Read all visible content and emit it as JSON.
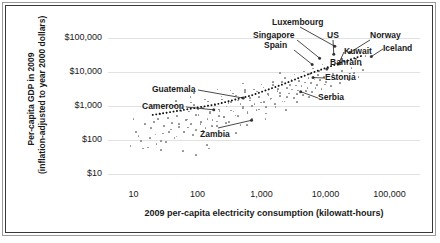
{
  "chart_data": {
    "type": "scatter",
    "title": "",
    "xlabel": "2009 per-capita electricity consumption (kilowatt-hours)",
    "ylabel_line1": "Per-capita GDP in 2009",
    "ylabel_line2": "(inflation-adjusted to year 2000 dollars)",
    "xscale": "log",
    "yscale": "log",
    "xlim": [
      4,
      300000
    ],
    "ylim": [
      6,
      300000
    ],
    "grid": true,
    "legend": "none",
    "xticks": [
      {
        "value": 10,
        "label": "10"
      },
      {
        "value": 100,
        "label": "100"
      },
      {
        "value": 1000,
        "label": "1,000"
      },
      {
        "value": 10000,
        "label": "10,000"
      },
      {
        "value": 100000,
        "label": "100,000"
      }
    ],
    "yticks": [
      {
        "value": 10,
        "label": "$10"
      },
      {
        "value": 100,
        "label": "$100"
      },
      {
        "value": 1000,
        "label": "$1,000"
      },
      {
        "value": 10000,
        "label": "$10,000"
      },
      {
        "value": 100000,
        "label": "$100,000"
      }
    ],
    "trendline": {
      "style": "dotted",
      "color": "#111111",
      "points": [
        [
          20,
          560
        ],
        [
          60,
          780
        ],
        [
          200,
          1150
        ],
        [
          700,
          2100
        ],
        [
          2000,
          4200
        ],
        [
          6000,
          9500
        ],
        [
          17000,
          19000
        ],
        [
          40000,
          32000
        ]
      ]
    },
    "annotations": [
      {
        "label": "Luxembourg",
        "x": 14000,
        "y": 58000
      },
      {
        "label": "US",
        "x": 13500,
        "y": 34000
      },
      {
        "label": "Norway",
        "x": 24000,
        "y": 38000
      },
      {
        "label": "Iceland",
        "x": 52000,
        "y": 29000
      },
      {
        "label": "Singapore",
        "x": 8100,
        "y": 26000
      },
      {
        "label": "Spain",
        "x": 6200,
        "y": 17000
      },
      {
        "label": "Kuwait",
        "x": 16000,
        "y": 17500
      },
      {
        "label": "Bahrain",
        "x": 10500,
        "y": 12500
      },
      {
        "label": "Estonia",
        "x": 6400,
        "y": 7000
      },
      {
        "label": "Serbia",
        "x": 4100,
        "y": 2700
      },
      {
        "label": "Guatemala",
        "x": 520,
        "y": 1750
      },
      {
        "label": "Cameroon",
        "x": 180,
        "y": 790
      },
      {
        "label": "Zambia",
        "x": 700,
        "y": 390
      }
    ],
    "points": [
      [
        11,
        180
      ],
      [
        13,
        96
      ],
      [
        15,
        310
      ],
      [
        17,
        62
      ],
      [
        19,
        230
      ],
      [
        22,
        150
      ],
      [
        24,
        420
      ],
      [
        27,
        95
      ],
      [
        30,
        260
      ],
      [
        33,
        640
      ],
      [
        36,
        180
      ],
      [
        40,
        330
      ],
      [
        44,
        120
      ],
      [
        48,
        520
      ],
      [
        52,
        250
      ],
      [
        57,
        880
      ],
      [
        62,
        170
      ],
      [
        68,
        410
      ],
      [
        74,
        700
      ],
      [
        80,
        300
      ],
      [
        88,
        1100
      ],
      [
        95,
        205
      ],
      [
        104,
        560
      ],
      [
        113,
        350
      ],
      [
        123,
        900
      ],
      [
        134,
        230
      ],
      [
        146,
        1400
      ],
      [
        158,
        620
      ],
      [
        172,
        400
      ],
      [
        187,
        1050
      ],
      [
        204,
        265
      ],
      [
        222,
        740
      ],
      [
        241,
        1600
      ],
      [
        262,
        480
      ],
      [
        285,
        980
      ],
      [
        310,
        350
      ],
      [
        337,
        1350
      ],
      [
        366,
        700
      ],
      [
        398,
        2100
      ],
      [
        432,
        520
      ],
      [
        470,
        1150
      ],
      [
        511,
        880
      ],
      [
        555,
        2600
      ],
      [
        603,
        640
      ],
      [
        655,
        1500
      ],
      [
        712,
        1000
      ],
      [
        774,
        3100
      ],
      [
        841,
        770
      ],
      [
        914,
        1900
      ],
      [
        993,
        1300
      ],
      [
        1080,
        3600
      ],
      [
        1173,
        950
      ],
      [
        1275,
        2300
      ],
      [
        1386,
        1600
      ],
      [
        1506,
        4200
      ],
      [
        1637,
        1150
      ],
      [
        1779,
        2800
      ],
      [
        1934,
        2000
      ],
      [
        2102,
        5100
      ],
      [
        2284,
        1400
      ],
      [
        2482,
        3400
      ],
      [
        2698,
        2400
      ],
      [
        2932,
        6200
      ],
      [
        3187,
        1750
      ],
      [
        3464,
        4100
      ],
      [
        3764,
        2900
      ],
      [
        4091,
        7500
      ],
      [
        4446,
        2150
      ],
      [
        4832,
        5000
      ],
      [
        5252,
        3500
      ],
      [
        5708,
        9000
      ],
      [
        6203,
        2600
      ],
      [
        6741,
        6100
      ],
      [
        7327,
        4300
      ],
      [
        7963,
        11000
      ],
      [
        8654,
        3200
      ],
      [
        9405,
        7400
      ],
      [
        10222,
        5200
      ],
      [
        11109,
        13500
      ],
      [
        12073,
        3900
      ],
      [
        13121,
        9000
      ],
      [
        14260,
        6400
      ],
      [
        15498,
        16500
      ],
      [
        16843,
        4800
      ],
      [
        18305,
        11000
      ],
      [
        19894,
        7800
      ],
      [
        21621,
        20000
      ],
      [
        23498,
        5900
      ],
      [
        25537,
        13500
      ],
      [
        27753,
        9500
      ],
      [
        30162,
        24500
      ],
      [
        32780,
        7200
      ],
      [
        35627,
        16500
      ],
      [
        38720,
        11600
      ],
      [
        42083,
        30000
      ],
      [
        9,
        70
      ],
      [
        10,
        420
      ],
      [
        12,
        135
      ],
      [
        14,
        58
      ],
      [
        16,
        900
      ],
      [
        18,
        115
      ],
      [
        21,
        340
      ],
      [
        23,
        78
      ],
      [
        26,
        600
      ],
      [
        29,
        160
      ],
      [
        32,
        90
      ],
      [
        35,
        450
      ],
      [
        39,
        210
      ],
      [
        43,
        1050
      ],
      [
        47,
        130
      ],
      [
        51,
        310
      ],
      [
        56,
        720
      ],
      [
        61,
        175
      ],
      [
        66,
        390
      ],
      [
        72,
        240
      ],
      [
        79,
        1300
      ],
      [
        86,
        145
      ],
      [
        94,
        560
      ],
      [
        102,
        820
      ],
      [
        111,
        300
      ],
      [
        121,
        195
      ],
      [
        132,
        1600
      ],
      [
        143,
        430
      ],
      [
        156,
        680
      ],
      [
        170,
        270
      ],
      [
        185,
        1150
      ],
      [
        201,
        360
      ],
      [
        219,
        800
      ],
      [
        238,
        1950
      ],
      [
        259,
        505
      ],
      [
        282,
        320
      ],
      [
        307,
        1250
      ],
      [
        334,
        760
      ],
      [
        363,
        2400
      ],
      [
        395,
        540
      ],
      [
        430,
        1500
      ],
      [
        468,
        285
      ],
      [
        509,
        980
      ],
      [
        554,
        3000
      ],
      [
        603,
        670
      ],
      [
        656,
        1750
      ],
      [
        714,
        430
      ],
      [
        777,
        1150
      ],
      [
        845,
        2700
      ],
      [
        920,
        800
      ],
      [
        1001,
        4400
      ],
      [
        1089,
        1350
      ],
      [
        1185,
        620
      ],
      [
        1290,
        2200
      ],
      [
        1403,
        1700
      ],
      [
        1527,
        5200
      ],
      [
        1662,
        960
      ],
      [
        1808,
        3200
      ],
      [
        1967,
        2450
      ],
      [
        2141,
        1400
      ],
      [
        2330,
        6800
      ],
      [
        2535,
        1850
      ],
      [
        2758,
        4300
      ],
      [
        3001,
        3100
      ],
      [
        3266,
        8600
      ],
      [
        3554,
        2300
      ],
      [
        3867,
        5500
      ],
      [
        4208,
        3900
      ],
      [
        4579,
        10500
      ],
      [
        4982,
        2850
      ],
      [
        5421,
        6900
      ],
      [
        5898,
        4800
      ],
      [
        6418,
        13000
      ],
      [
        6984,
        3500
      ],
      [
        7600,
        8500
      ],
      [
        8269,
        5900
      ],
      [
        8998,
        17000
      ],
      [
        9790,
        4400
      ],
      [
        60,
        48
      ],
      [
        95,
        38
      ],
      [
        140,
        72
      ],
      [
        46,
        1450
      ],
      [
        215,
        510
      ],
      [
        330,
        2900
      ],
      [
        19,
        1050
      ],
      [
        27,
        52
      ],
      [
        400,
        165
      ],
      [
        600,
        280
      ],
      [
        150,
        58
      ],
      [
        78,
        1850
      ],
      [
        1150,
        420
      ],
      [
        2400,
        780
      ],
      [
        3600,
        1350
      ],
      [
        88,
        2500
      ],
      [
        205,
        3100
      ],
      [
        520,
        4700
      ],
      [
        1950,
        9500
      ],
      [
        5500,
        1900
      ]
    ]
  }
}
